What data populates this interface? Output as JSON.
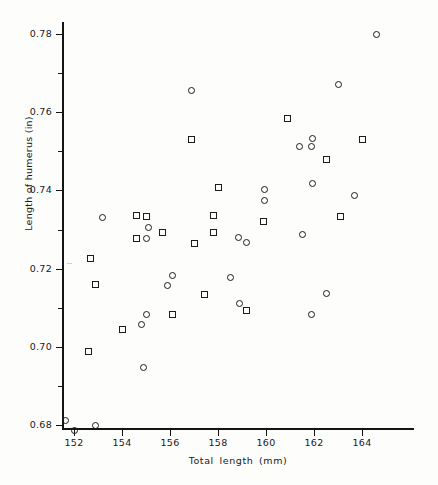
{
  "chart_data": {
    "type": "scatter",
    "title": "",
    "xlabel": "Total  length  (mm)",
    "ylabel": "Length of humerus (in)",
    "xlim": [
      151.5,
      166.2
    ],
    "ylim": [
      0.6745,
      0.7825
    ],
    "xticks": [
      152,
      154,
      156,
      158,
      160,
      162,
      164
    ],
    "yticks": [
      0.68,
      0.7,
      0.72,
      0.74,
      0.76,
      0.78
    ],
    "xticklabels": [
      "152",
      "154",
      "156",
      "158",
      "160",
      "162",
      "164"
    ],
    "yticklabels": [
      "0.68",
      "0.70",
      "0.72",
      "0.74",
      "0.76",
      "0.78"
    ],
    "xminorticks": [
      153,
      155,
      157,
      159,
      161,
      163,
      165
    ],
    "yminorticks": [
      0.69,
      0.71,
      0.73,
      0.75,
      0.77
    ],
    "grid": false,
    "legend": null,
    "series": [
      {
        "name": "circle",
        "marker": "circle",
        "points": [
          [
            151.65,
            0.6812
          ],
          [
            152.0,
            0.6785
          ],
          [
            152.9,
            0.68
          ],
          [
            153.2,
            0.733
          ],
          [
            154.8,
            0.7057
          ],
          [
            155.0,
            0.7083
          ],
          [
            154.9,
            0.6947
          ],
          [
            155.1,
            0.7305
          ],
          [
            155.0,
            0.7278
          ],
          [
            155.9,
            0.7158
          ],
          [
            156.1,
            0.7183
          ],
          [
            156.9,
            0.7655
          ],
          [
            158.5,
            0.7177
          ],
          [
            158.9,
            0.711
          ],
          [
            158.85,
            0.728
          ],
          [
            159.2,
            0.7267
          ],
          [
            159.95,
            0.7402
          ],
          [
            159.95,
            0.7375
          ],
          [
            161.4,
            0.7512
          ],
          [
            161.5,
            0.7288
          ],
          [
            161.95,
            0.7533
          ],
          [
            161.9,
            0.7512
          ],
          [
            161.95,
            0.7417
          ],
          [
            161.9,
            0.7083
          ],
          [
            162.5,
            0.7137
          ],
          [
            163.0,
            0.7672
          ],
          [
            163.7,
            0.7388
          ],
          [
            164.6,
            0.78
          ]
        ]
      },
      {
        "name": "square",
        "marker": "square",
        "points": [
          [
            152.6,
            0.6988
          ],
          [
            152.7,
            0.7225
          ],
          [
            152.9,
            0.716
          ],
          [
            154.0,
            0.7045
          ],
          [
            154.6,
            0.7335
          ],
          [
            154.6,
            0.7277
          ],
          [
            155.0,
            0.7333
          ],
          [
            155.7,
            0.7293
          ],
          [
            156.1,
            0.7083
          ],
          [
            156.9,
            0.753
          ],
          [
            157.0,
            0.7265
          ],
          [
            157.45,
            0.7133
          ],
          [
            157.8,
            0.7335
          ],
          [
            157.8,
            0.7292
          ],
          [
            158.0,
            0.7408
          ],
          [
            159.2,
            0.7093
          ],
          [
            159.9,
            0.732
          ],
          [
            160.9,
            0.7585
          ],
          [
            162.5,
            0.748
          ],
          [
            163.1,
            0.7333
          ],
          [
            164.0,
            0.753
          ]
        ]
      }
    ]
  },
  "axes": {
    "x_title": "Total  length  (mm)",
    "y_title": "Length of humerus (in)"
  }
}
